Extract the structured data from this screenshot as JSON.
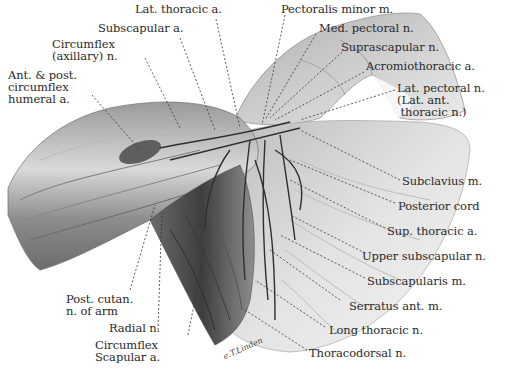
{
  "figure": {
    "signature": "e.T.Linden"
  },
  "labels": {
    "lat_thoracic_a": "Lat. thoracic a.",
    "subscapular_a": "Subscapular a.",
    "circumflex_axillary_n": "Circumflex\n(axillary) n.",
    "ant_post_circumflex_humeral_a": "Ant. & post.\ncircumflex\nhumeral a.",
    "pectoralis_minor_m": "Pectoralis minor m.",
    "med_pectoral_n": "Med. pectoral n.",
    "suprascapular_n": "Suprascapular n.",
    "acromiothoracic_a": "Acromiothoracic a.",
    "lat_pectoral_n": "Lat. pectoral n.\n(Lat. ant.\n thoracic n.)",
    "subclavius_m": "Subclavius m.",
    "posterior_cord": "Posterior cord",
    "sup_thoracic_a": "Sup. thoracic a.",
    "upper_subscapular_n": "Upper subscapular n.",
    "subscapularis_m": "Subscapularis m.",
    "serratus_ant_m": "Serratus ant. m.",
    "long_thoracic_n": "Long thoracic n.",
    "thoracodorsal_n": "Thoracodorsal n.",
    "post_cutan_n_of_arm": "Post. cutan.\nn. of arm",
    "radial_n": "Radial n.",
    "circumflex_scapular_a": "Circumflex\nScapular a."
  },
  "colors": {
    "background": "#ffffff",
    "text": "#2a2a2a",
    "leader": "#333333",
    "tissue_light": "#d8d8d8",
    "tissue_mid": "#a8a8a8",
    "tissue_dark": "#5a5a5a"
  }
}
